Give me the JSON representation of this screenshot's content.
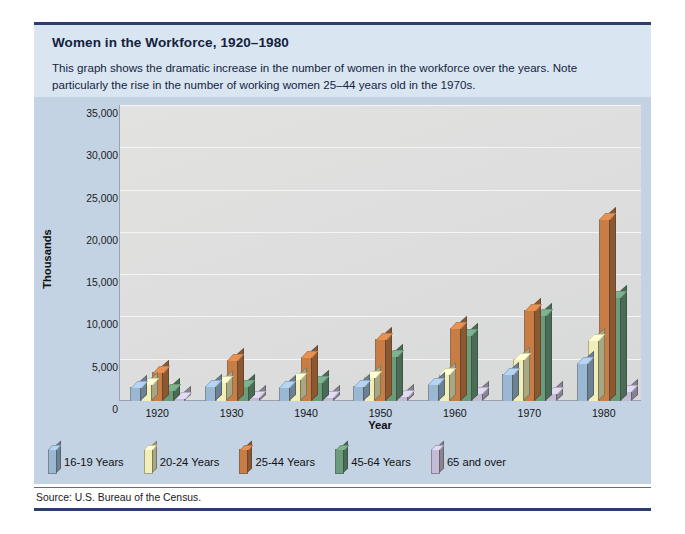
{
  "figure": {
    "title": "Women in the Workforce, 1920–1980",
    "description": "This graph shows the dramatic increase in the number of women in the workforce over the years. Note particularly the rise in the number of working women 25–44 years old in the 1970s.",
    "source": "Source: U.S. Bureau of the Census.",
    "accent_rule_color": "#2c3d6e",
    "header_band_color": "#d9e6f2",
    "chart_band_color": "#c3d3e4",
    "plot_background_color": "#dedede"
  },
  "chart_data": {
    "type": "bar",
    "title": "Women in the Workforce, 1920–1980",
    "subtitle": "",
    "xlabel": "Year",
    "ylabel": "Thousands",
    "categories": [
      "1920",
      "1930",
      "1940",
      "1950",
      "1960",
      "1970",
      "1980"
    ],
    "ylim": [
      0,
      35000
    ],
    "yticks": [
      "0",
      "5,000",
      "10,000",
      "15,000",
      "20,000",
      "25,000",
      "30,000",
      "35,000"
    ],
    "ytick_values": [
      0,
      5000,
      10000,
      15000,
      20000,
      25000,
      30000,
      35000
    ],
    "grid": true,
    "legend_position": "below-plot",
    "orientation": "vertical-grouped-3d",
    "series": [
      {
        "name": "16-19 Years",
        "color": "#9bb8d3",
        "values": [
          1700,
          1800,
          1700,
          1800,
          2000,
          3200,
          4500
        ]
      },
      {
        "name": "20-24 Years",
        "color": "#f2eeb8",
        "values": [
          2000,
          2300,
          2600,
          2800,
          3200,
          5000,
          7200
        ]
      },
      {
        "name": "25-44 Years",
        "color": "#c87d45",
        "values": [
          3400,
          4800,
          5200,
          7300,
          8600,
          10800,
          21500
        ]
      },
      {
        "name": "45-64 Years",
        "color": "#6a9b7a",
        "values": [
          1300,
          1800,
          2300,
          5300,
          7800,
          10200,
          12300
        ]
      },
      {
        "name": "65 and over",
        "color": "#c4bcd4",
        "values": [
          400,
          450,
          500,
          650,
          900,
          1000,
          1200
        ]
      }
    ]
  }
}
